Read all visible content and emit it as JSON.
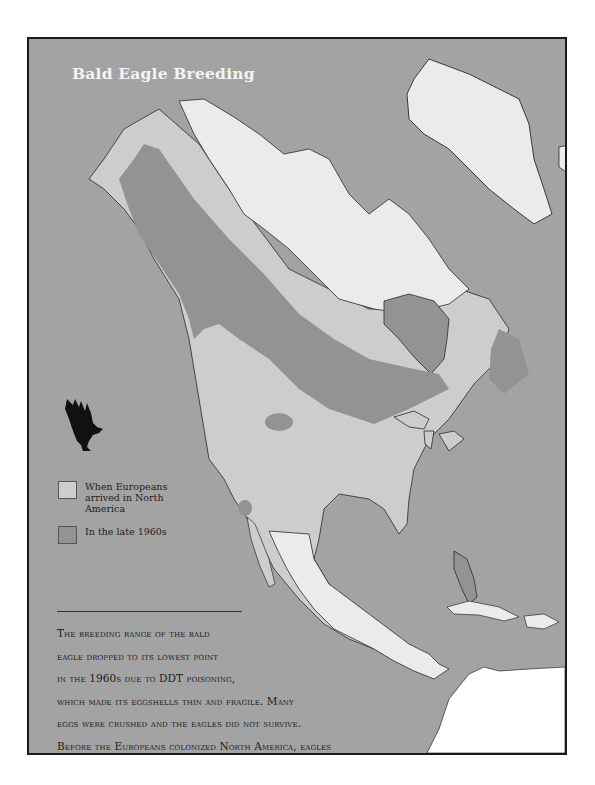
{
  "map": {
    "title": "Bald Eagle Breeding",
    "colors": {
      "ocean": "#a3a3a3",
      "range_when_europeans_arrived": "#cdcdcd",
      "range_late_1960s": "#939393",
      "outside_range": "#ebebeb",
      "south_america": "#ffffff",
      "frame": "#1a1a1a"
    },
    "legend": {
      "items": [
        {
          "label": "When Europeans arrived in North America",
          "color": "#cdcdcd",
          "icon": "light-swatch"
        },
        {
          "label": "In the late 1960s",
          "color": "#939393",
          "icon": "dark-swatch"
        }
      ]
    },
    "eagle_icon": "eagle-silhouette-icon",
    "caption": {
      "lines": [
        "The breeding range of the bald",
        "eagle dropped to its lowest point",
        "in the 1960s due to DDT poisoning,",
        "which made its eggshells thin and fragile. Many",
        "eggs were crushed and the eagles did not survive.",
        "Before the Europeans colonized North America, eagles",
        "flew free over most of the continent."
      ]
    }
  }
}
